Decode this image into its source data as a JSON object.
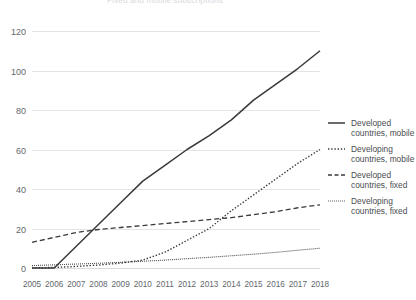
{
  "chart_data": {
    "type": "line",
    "title": "Fixed and mobile subscriptions",
    "xlabel": "",
    "ylabel": "",
    "x": [
      2005,
      2006,
      2007,
      2008,
      2009,
      2010,
      2011,
      2012,
      2013,
      2014,
      2015,
      2016,
      2017,
      2018
    ],
    "xtick_labels": [
      "2005",
      "2006",
      "2007",
      "2008",
      "2009",
      "2010",
      "2011",
      "2012",
      "2013",
      "2014",
      "2015",
      "2016",
      "2017",
      "2018"
    ],
    "ytick_labels": [
      "0",
      "20",
      "40",
      "60",
      "80",
      "100",
      "120"
    ],
    "yticks": [
      0,
      20,
      40,
      60,
      80,
      100,
      120
    ],
    "ylim": [
      0,
      120
    ],
    "xlim": [
      2005,
      2018
    ],
    "grid": "horizontal",
    "legend_position": "right",
    "series": [
      {
        "name": "Developed countries, mobile",
        "style": "solid",
        "color": "#3a3a3a",
        "width": 1.5,
        "values": [
          0,
          0,
          11,
          22,
          33,
          44,
          52,
          60,
          67,
          75,
          85,
          93,
          101,
          110
        ]
      },
      {
        "name": "Developing countries, mobile",
        "style": "dotted",
        "color": "#3a3a3a",
        "width": 1.4,
        "values": [
          0,
          0.3,
          0.8,
          1.5,
          2.5,
          4,
          8,
          14,
          20,
          29,
          37,
          45,
          53,
          60
        ]
      },
      {
        "name": "Developed countries, fixed",
        "style": "dashed",
        "color": "#3a3a3a",
        "width": 1.3,
        "values": [
          13,
          15.5,
          18,
          19.5,
          20.5,
          21.5,
          22.5,
          23.5,
          24.5,
          25.5,
          27,
          28.5,
          30.5,
          32
        ]
      },
      {
        "name": "Developing countries, fixed",
        "style": "fine",
        "color": "#4a4a4a",
        "width": 1.1,
        "values": [
          1.2,
          1.6,
          2.0,
          2.4,
          2.9,
          3.4,
          4.0,
          4.7,
          5.4,
          6.2,
          7.0,
          7.9,
          9.0,
          10.0
        ]
      }
    ]
  },
  "legend": {
    "entries": [
      {
        "line1": "Developed",
        "line2": "countries, mobile",
        "style": "solid"
      },
      {
        "line1": "Developing",
        "line2": "countries, mobile",
        "style": "dotted"
      },
      {
        "line1": "Developed",
        "line2": "countries, fixed",
        "style": "dashed"
      },
      {
        "line1": "Developing",
        "line2": "countries, fixed",
        "style": "fine"
      }
    ]
  }
}
